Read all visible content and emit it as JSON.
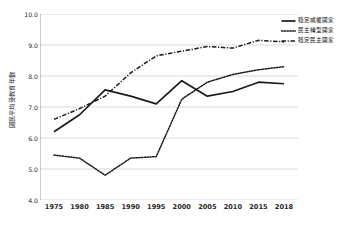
{
  "chart_data": {
    "type": "line",
    "title": "",
    "xlabel": "",
    "ylabel": "國民平均受教育年數",
    "categories": [
      "1975",
      "1980",
      "1985",
      "1990",
      "1995",
      "2000",
      "2005",
      "2010",
      "2015",
      "2018"
    ],
    "ylim": [
      4.0,
      10.0
    ],
    "ytick_step": 1.0,
    "yticks": [
      "4.0",
      "5.0",
      "6.0",
      "7.0",
      "8.0",
      "9.0",
      "10.0"
    ],
    "grid": "horizontal",
    "legend_position": "top-right",
    "series": [
      {
        "name": "穩定威權國家",
        "style": "solid",
        "color": "#1a1a1a",
        "values": [
          6.2,
          6.75,
          7.55,
          7.35,
          7.1,
          7.85,
          7.35,
          7.5,
          7.8,
          7.75
        ]
      },
      {
        "name": "民主轉型國家",
        "style": "dotted",
        "color": "#1a1a1a",
        "values": [
          5.45,
          5.35,
          4.8,
          5.35,
          5.4,
          7.25,
          7.8,
          8.05,
          8.2,
          8.3
        ]
      },
      {
        "name": "穩定民主國家",
        "style": "dash-dot",
        "color": "#1a1a1a",
        "values": [
          6.6,
          6.95,
          7.35,
          8.1,
          8.65,
          8.8,
          8.95,
          8.9,
          9.15,
          9.1
        ]
      }
    ]
  },
  "axis": {
    "y_title": "國民平均受教育年數"
  },
  "legend": {
    "items": [
      {
        "label": "穩定威權國家"
      },
      {
        "label": "民主轉型國家"
      },
      {
        "label": "穩定民主國家"
      }
    ]
  }
}
